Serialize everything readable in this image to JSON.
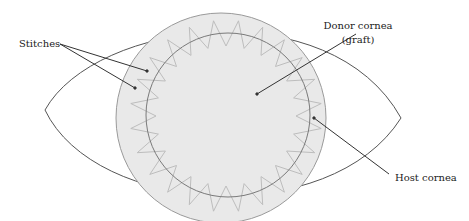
{
  "diagram": {
    "type": "anatomical schematic",
    "labels": {
      "stitches": "Stitches",
      "donor_line1": "Donor cornea",
      "donor_line2": "(graft)",
      "host": "Host cornea"
    },
    "colors": {
      "outline": "#555555",
      "cornea_fill": "#e9e9e9",
      "cornea_stroke": "#9a9a9a",
      "graft_stroke": "#7a7a7a",
      "stitch": "#bdbdbd",
      "leader": "#333333"
    },
    "stitch_count": 24
  }
}
